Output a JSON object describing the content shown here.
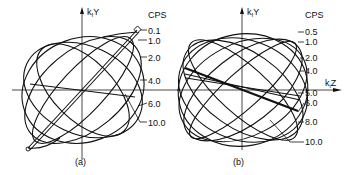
{
  "panels": [
    {
      "id": "a",
      "caption": "(a)",
      "y_axis_label": "k",
      "y_axis_sub": "f",
      "y_axis_var": "Y",
      "legend_title": "CPS",
      "freq_labels": [
        "0.1",
        "1.0",
        "2.0",
        "4.0",
        "6.0",
        "10.0"
      ]
    },
    {
      "id": "b",
      "caption": "(b)",
      "y_axis_label": "k",
      "y_axis_sub": "f",
      "y_axis_var": "Y",
      "x_axis_label": "k",
      "x_axis_sub": "i",
      "x_axis_var": "Z",
      "legend_title": "CPS",
      "freq_labels": [
        "0.5",
        "1.0",
        "2.0",
        "4.0",
        "5.0",
        "6.0",
        "8.0",
        "10.0"
      ]
    }
  ]
}
